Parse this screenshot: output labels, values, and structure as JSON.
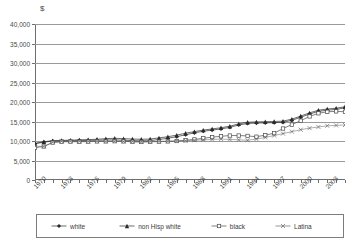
{
  "chart_data": {
    "type": "line",
    "title": "",
    "subtitle": "",
    "xlabel": "",
    "ylabel": "$",
    "ylim": [
      0,
      40000
    ],
    "xlim": [
      1970,
      2003
    ],
    "grid": true,
    "legend_position": "bottom",
    "y_ticks": [
      "0",
      "5,000",
      "10,000",
      "15,000",
      "20,000",
      "25,000",
      "30,000",
      "35,000",
      "40,000"
    ],
    "y_tick_values": [
      0,
      5000,
      10000,
      15000,
      20000,
      25000,
      30000,
      35000,
      40000
    ],
    "x_tick_labels": [
      "1970",
      "1973",
      "1976",
      "1979",
      "1982",
      "1985",
      "1988",
      "1991",
      "1994",
      "1997",
      "2000",
      "2003"
    ],
    "x_all_years": [
      1970,
      1971,
      1972,
      1973,
      1974,
      1975,
      1976,
      1977,
      1978,
      1979,
      1980,
      1981,
      1982,
      1983,
      1984,
      1985,
      1986,
      1987,
      1988,
      1989,
      1990,
      1991,
      1992,
      1993,
      1994,
      1995,
      1996,
      1997,
      1998,
      1999,
      2000,
      2001,
      2002,
      2003
    ],
    "series": [
      {
        "name": "white",
        "marker": "filled-diamond",
        "color": "#2b2b2b",
        "values": [
          9300,
          9700,
          10000,
          10000,
          10050,
          10100,
          10150,
          10200,
          10250,
          10300,
          10200,
          10100,
          10050,
          10100,
          10400,
          10700,
          11100,
          11600,
          12100,
          12500,
          12800,
          13100,
          13500,
          14100,
          14500,
          14600,
          14650,
          14700,
          14800,
          15300,
          16100,
          16900,
          17600,
          17900,
          18100,
          18500
        ]
      },
      {
        "name": "non Hisp white",
        "marker": "filled-triangle",
        "color": "#2b2b2b",
        "values": [
          9400,
          9800,
          10100,
          10150,
          10200,
          10300,
          10350,
          10450,
          10600,
          10700,
          10600,
          10500,
          10450,
          10500,
          10800,
          11100,
          11500,
          12000,
          12400,
          12800,
          13100,
          13400,
          13800,
          14400,
          14800,
          14900,
          14950,
          15000,
          15100,
          15600,
          16400,
          17200,
          17900,
          18200,
          18400,
          18800
        ]
      },
      {
        "name": "black",
        "marker": "open-square",
        "color": "#4a4a4a",
        "values": [
          8300,
          8600,
          9600,
          9800,
          9850,
          9800,
          9850,
          9900,
          9900,
          9950,
          9900,
          9800,
          9750,
          9800,
          9850,
          9900,
          10000,
          10200,
          10400,
          10700,
          11000,
          11200,
          11400,
          11400,
          11300,
          11100,
          11500,
          12000,
          13200,
          14200,
          15200,
          16300,
          17100,
          17500,
          17600,
          17500
        ]
      },
      {
        "name": "Latina",
        "marker": "cross-x",
        "color": "#6a6a6a",
        "values": [
          8700,
          8600,
          9700,
          9900,
          9950,
          9900,
          9900,
          9950,
          9900,
          9950,
          9900,
          9850,
          9800,
          9850,
          9900,
          9950,
          10000,
          10100,
          10200,
          10300,
          10400,
          10500,
          10400,
          10300,
          10200,
          10500,
          10900,
          11400,
          11900,
          12400,
          12900,
          13300,
          13600,
          13900,
          14000,
          14100
        ]
      }
    ]
  },
  "legend": {
    "entries": [
      {
        "label": "white"
      },
      {
        "label": "non Hisp white"
      },
      {
        "label": "black"
      },
      {
        "label": "Latina"
      }
    ]
  },
  "axis": {
    "currency_symbol": "$"
  }
}
